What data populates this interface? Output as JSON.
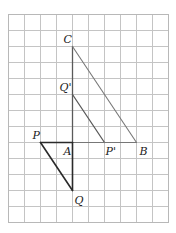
{
  "grid": {
    "origin_x": 8,
    "origin_y": 14,
    "cell_size": 16,
    "columns": 10,
    "rows": 13
  },
  "points": [
    {
      "id": "C",
      "label": "C",
      "col": 4,
      "row": 2,
      "label_dx": -9,
      "label_dy": -4
    },
    {
      "id": "Qp",
      "label": "Q'",
      "col": 4,
      "row": 5,
      "label_dx": -13,
      "label_dy": -4
    },
    {
      "id": "P",
      "label": "P",
      "col": 2,
      "row": 8,
      "label_dx": -8,
      "label_dy": -4
    },
    {
      "id": "A",
      "label": "A",
      "col": 4,
      "row": 8,
      "label_dx": -9,
      "label_dy": 12
    },
    {
      "id": "Pp",
      "label": "P'",
      "col": 6,
      "row": 8,
      "label_dx": 1,
      "label_dy": 12
    },
    {
      "id": "B",
      "label": "B",
      "col": 8,
      "row": 8,
      "label_dx": 3,
      "label_dy": 12
    },
    {
      "id": "Q",
      "label": "Q",
      "col": 4,
      "row": 11,
      "label_dx": 2,
      "label_dy": 13
    }
  ],
  "segments": [
    {
      "from": "C",
      "to": "A",
      "style": "mid"
    },
    {
      "from": "C",
      "to": "B",
      "style": "light"
    },
    {
      "from": "Qp",
      "to": "Pp",
      "style": "mid"
    },
    {
      "from": "A",
      "to": "B",
      "style": "light"
    },
    {
      "from": "P",
      "to": "A",
      "style": "dark"
    },
    {
      "from": "P",
      "to": "Q",
      "style": "dark"
    },
    {
      "from": "A",
      "to": "Q",
      "style": "dark"
    }
  ]
}
